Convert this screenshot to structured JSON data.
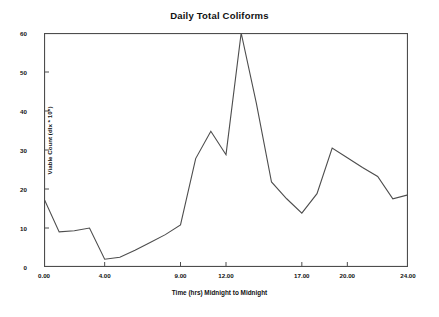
{
  "chart_data": {
    "type": "line",
    "title": "Daily Total Coliforms",
    "xlabel": "Time (hrs)  Midnight to Midnight",
    "ylabel": "Viable Count  (dlx * 10⁵)",
    "xlim": [
      0,
      24
    ],
    "ylim": [
      0,
      60
    ],
    "grid": false,
    "legend": "none",
    "line_color": "#4d4d4d",
    "xticks": [
      0,
      4,
      9,
      12,
      17,
      20,
      24
    ],
    "xtick_labels": [
      "0.00",
      "4.00",
      "9.00",
      "12.00",
      "17.00",
      "20.00",
      "24.00"
    ],
    "yticks": [
      0,
      10,
      20,
      30,
      40,
      50,
      60
    ],
    "ytick_labels": [
      "0",
      "10",
      "20",
      "30",
      "40",
      "50",
      "60"
    ],
    "x": [
      0,
      1,
      2,
      3,
      4,
      5,
      6,
      7,
      8,
      9,
      10,
      11,
      12,
      13,
      14,
      15,
      16,
      17,
      18,
      19,
      20,
      21,
      22,
      23,
      24
    ],
    "values": [
      17.5,
      9.0,
      9.3,
      10.0,
      2.0,
      2.5,
      4.3,
      6.3,
      8.3,
      10.8,
      27.8,
      34.8,
      28.8,
      60.0,
      42.0,
      21.8,
      17.5,
      13.8,
      18.8,
      30.5,
      28.0,
      25.5,
      23.2,
      17.5,
      18.5
    ],
    "series_name": "Total Coliforms"
  }
}
